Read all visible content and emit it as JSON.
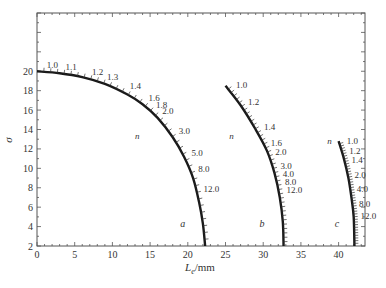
{
  "chart_data": {
    "type": "line",
    "title": "",
    "xlabel": "L_e/mm",
    "xlabel_main": "L",
    "xlabel_sub": "e",
    "xlabel_unit": "/mm",
    "ylabel": "σ",
    "xlim": [
      0,
      43.5
    ],
    "ylim": [
      2,
      26
    ],
    "x_ticks": [
      0,
      5,
      10,
      15,
      20,
      25,
      30,
      35,
      40
    ],
    "y_ticks": [
      2,
      4,
      6,
      8,
      10,
      12,
      14,
      16,
      18,
      20
    ],
    "grid": false,
    "legend": "none",
    "series": [
      {
        "name": "a",
        "param_label": "n",
        "points": [
          [
            0,
            20
          ],
          [
            3,
            19.8
          ],
          [
            6,
            19.4
          ],
          [
            9,
            18.7
          ],
          [
            12,
            17.6
          ],
          [
            14,
            16.6
          ],
          [
            16,
            15.2
          ],
          [
            18,
            13.2
          ],
          [
            19.5,
            11.2
          ],
          [
            20.7,
            9
          ],
          [
            21.5,
            6.5
          ],
          [
            22,
            4.3
          ],
          [
            22.3,
            2
          ]
        ],
        "n_marks": [
          {
            "n": "1.0",
            "x": 0.5,
            "y": 20
          },
          {
            "n": "1.1",
            "x": 3,
            "y": 19.8
          },
          {
            "n": "1.2",
            "x": 6.5,
            "y": 19.3
          },
          {
            "n": "1.3",
            "x": 8.5,
            "y": 18.8
          },
          {
            "n": "1.4",
            "x": 11.5,
            "y": 17.9
          },
          {
            "n": "1.6",
            "x": 14,
            "y": 16.6
          },
          {
            "n": "1.8",
            "x": 15,
            "y": 15.9
          },
          {
            "n": "2.0",
            "x": 15.8,
            "y": 15.3
          },
          {
            "n": "3.0",
            "x": 18,
            "y": 13.2
          },
          {
            "n": "5.0",
            "x": 19.7,
            "y": 11
          },
          {
            "n": "8.0",
            "x": 20.6,
            "y": 9.3
          },
          {
            "n": "12.0",
            "x": 21.3,
            "y": 7.3
          }
        ],
        "curve_label": "a"
      },
      {
        "name": "b",
        "param_label": "n",
        "points": [
          [
            25,
            18.5
          ],
          [
            27,
            16.5
          ],
          [
            29,
            14
          ],
          [
            30.5,
            11.8
          ],
          [
            31.5,
            9.5
          ],
          [
            32.2,
            7
          ],
          [
            32.6,
            4.5
          ],
          [
            32.7,
            2
          ]
        ],
        "n_marks": [
          {
            "n": "1.0",
            "x": 25.6,
            "y": 18
          },
          {
            "n": "1.2",
            "x": 27.2,
            "y": 16.2
          },
          {
            "n": "1.4",
            "x": 29.3,
            "y": 13.6
          },
          {
            "n": "1.6",
            "x": 30.2,
            "y": 12
          },
          {
            "n": "2.0",
            "x": 30.8,
            "y": 11.1
          },
          {
            "n": "3.0",
            "x": 31.5,
            "y": 9.6
          },
          {
            "n": "4.0",
            "x": 31.8,
            "y": 8.8
          },
          {
            "n": "8.0",
            "x": 32.1,
            "y": 8
          },
          {
            "n": "12.0",
            "x": 32.3,
            "y": 7.2
          }
        ],
        "curve_label": "b"
      },
      {
        "name": "c",
        "param_label": "n",
        "points": [
          [
            40,
            12.8
          ],
          [
            40.7,
            11
          ],
          [
            41.3,
            9
          ],
          [
            41.7,
            7
          ],
          [
            42,
            5
          ],
          [
            42.1,
            2
          ]
        ],
        "n_marks": [
          {
            "n": "1.0",
            "x": 40.3,
            "y": 12.2
          },
          {
            "n": "1.2",
            "x": 40.6,
            "y": 11.2
          },
          {
            "n": "1.4",
            "x": 40.9,
            "y": 10.2
          },
          {
            "n": "2.0",
            "x": 41.3,
            "y": 8.7
          },
          {
            "n": "4.0",
            "x": 41.6,
            "y": 7.3
          },
          {
            "n": "8.0",
            "x": 41.9,
            "y": 5.7
          },
          {
            "n": "12.0",
            "x": 42.1,
            "y": 4.5
          }
        ],
        "curve_label": "c"
      }
    ],
    "annotations": [
      "n",
      "a",
      "b",
      "c"
    ]
  },
  "labels": {
    "ylabel": "σ",
    "xlabel_main": "L",
    "xlabel_sub": "e",
    "xlabel_unit": "/mm"
  }
}
